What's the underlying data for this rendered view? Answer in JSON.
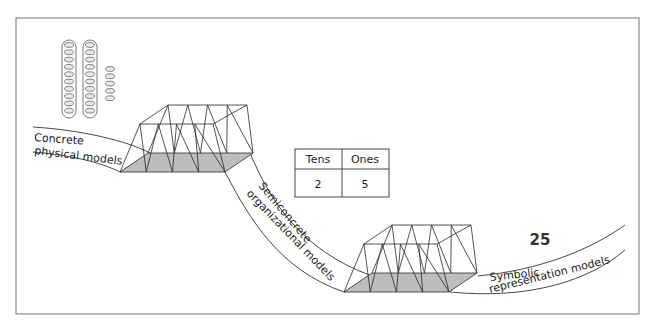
{
  "diagram": {
    "stages": [
      {
        "id": "concrete",
        "label_line1": "Concrete",
        "label_line2": "physical models"
      },
      {
        "id": "semiconcrete",
        "label_line1": "Semiconcrete",
        "label_line2": "organizational models"
      },
      {
        "id": "symbolic",
        "label_line1": "Symbolic",
        "label_line2": "representation models"
      }
    ],
    "place_value_table": {
      "headers": [
        "Tens",
        "Ones"
      ],
      "values": [
        "2",
        "5"
      ]
    },
    "symbol": "25",
    "beads": {
      "tens_rods": 2,
      "beads_per_rod": 10,
      "loose_ones": 5
    },
    "colors": {
      "frame": "#8a8a8a",
      "floor_fill": "#bdbdbd",
      "line": "#2a2a2a"
    }
  }
}
